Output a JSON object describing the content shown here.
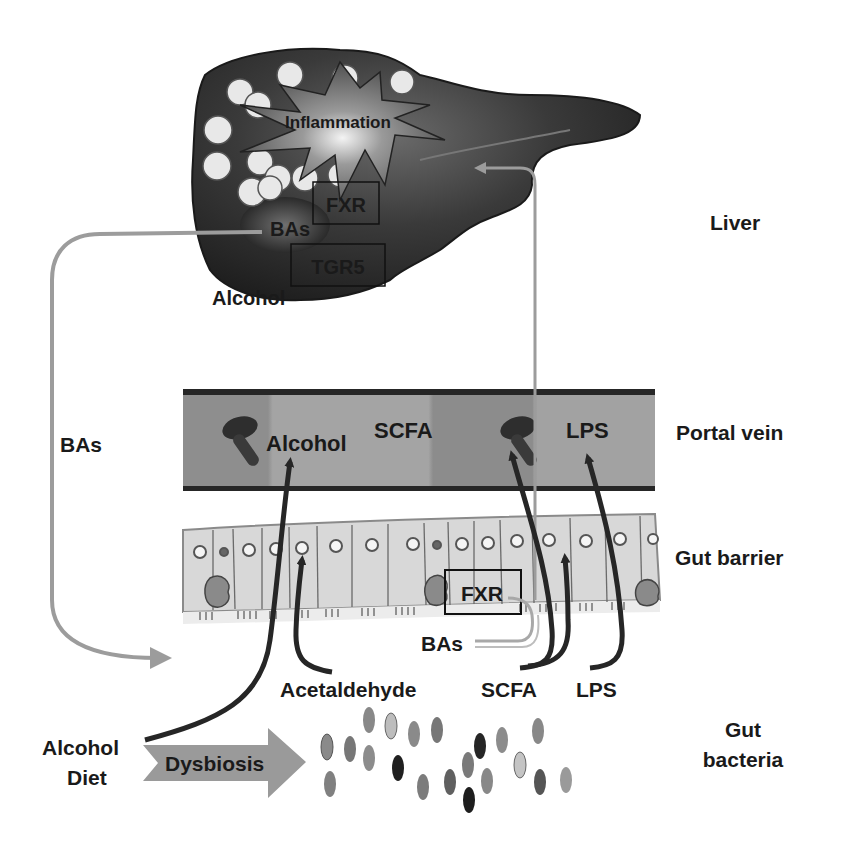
{
  "colors": {
    "liver_dark": "#2a2a2a",
    "liver_mid": "#4a4a4a",
    "vein_fill": "#9a9a9a",
    "vein_border": "#262626",
    "cell_fill": "#dcdcdc",
    "arrow_dark": "#262626",
    "arrow_gray": "#9c9c9c",
    "text": "#1a1a1a"
  },
  "layers": {
    "liver": "Liver",
    "portal_vein": "Portal vein",
    "gut_barrier": "Gut barrier",
    "gut_bacteria_line1": "Gut",
    "gut_bacteria_line2": "bacteria"
  },
  "liver": {
    "inflammation": "Inflammation",
    "fxr": "FXR",
    "bas": "BAs",
    "tgr5": "TGR5",
    "alcohol": "Alcohol"
  },
  "portal_vein": {
    "alcohol": "Alcohol",
    "scfa": "SCFA",
    "lps": "LPS"
  },
  "gut_barrier": {
    "fxr": "FXR",
    "bas": "BAs"
  },
  "lumen": {
    "acetaldehyde": "Acetaldehyde",
    "scfa": "SCFA",
    "lps": "LPS"
  },
  "left_loop": {
    "bas": "BAs"
  },
  "inputs": {
    "alcohol": "Alcohol",
    "diet": "Diet",
    "dysbiosis": "Dysbiosis"
  }
}
